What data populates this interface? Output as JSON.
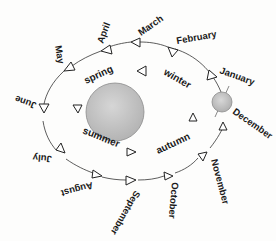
{
  "diagram": {
    "title": "",
    "sun": {
      "label": "",
      "color": "#c8c8c8"
    },
    "earth": {
      "label": "",
      "color": "#c4c4c4"
    },
    "months": [
      {
        "label": "March"
      },
      {
        "label": "April"
      },
      {
        "label": "May"
      },
      {
        "label": "June"
      },
      {
        "label": "July"
      },
      {
        "label": "August"
      },
      {
        "label": "September"
      },
      {
        "label": "October"
      },
      {
        "label": "November"
      },
      {
        "label": "December"
      },
      {
        "label": "January"
      },
      {
        "label": "February"
      }
    ],
    "seasons": [
      {
        "label": "spring"
      },
      {
        "label": "summer"
      },
      {
        "label": "autumn"
      },
      {
        "label": "winter"
      }
    ]
  }
}
